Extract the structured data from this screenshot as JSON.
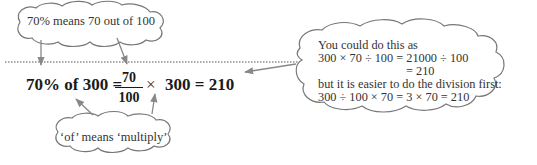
{
  "top_callout": {
    "text": "70% means 70 out of 100"
  },
  "bottom_callout": {
    "text": "‘of’ means ‘multiply’"
  },
  "equation": {
    "left": "70% of 300 =",
    "fraction_numerator": "70",
    "fraction_denominator": "100",
    "times": "×",
    "right": "300 = 210"
  },
  "right_callout": {
    "lines": [
      "You could do this as",
      "300 × 70 ÷ 100 = 21000 ÷ 100",
      "= 210",
      "but it is easier to do the division first:",
      "300 ÷ 100 × 70 = 3 × 70 = 210"
    ]
  },
  "colors": {
    "cloud_stroke": "#777777",
    "arrow": "#888888",
    "text": "#222222"
  }
}
